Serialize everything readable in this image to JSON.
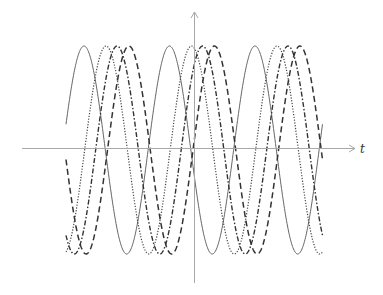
{
  "chart_data": {
    "type": "line",
    "title": "",
    "xlabel": "t",
    "ylabel": "",
    "grid": false,
    "legend": null,
    "x_range_periods": [
      0,
      3
    ],
    "ylim": [
      -1,
      1
    ],
    "series": [
      {
        "name": "solid",
        "style": "solid",
        "amplitude": 1,
        "phase_rad": 0.25,
        "color": "#555555",
        "width": 0.9
      },
      {
        "name": "dotted",
        "style": "dotted",
        "amplitude": 1,
        "phase_rad": -1.37,
        "color": "#444444",
        "width": 1.2
      },
      {
        "name": "dash-dot",
        "style": "dashdot",
        "amplitude": 1,
        "phase_rad": -2.18,
        "color": "#333333",
        "width": 1.4
      },
      {
        "name": "dashed",
        "style": "dashed",
        "amplitude": 1,
        "phase_rad": -3.05,
        "color": "#333333",
        "width": 1.5
      }
    ]
  },
  "axes": {
    "x_label": "t"
  }
}
